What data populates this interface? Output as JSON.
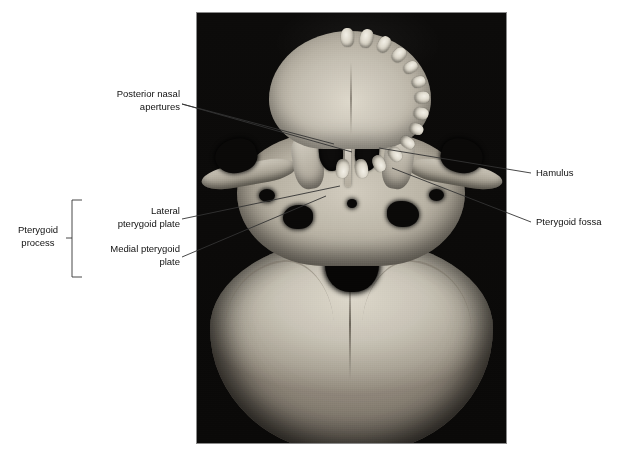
{
  "figure": {
    "background_color": "#ffffff",
    "photo": {
      "kind": "photograph",
      "subject": "inferior view of human skull base",
      "background_color": "#0a0908",
      "bone_color": "#c9c3b6",
      "border_color": "#8a8a8a",
      "x": 197,
      "y": 13,
      "width": 309,
      "height": 430
    },
    "line_color": "#333333",
    "labels": [
      {
        "id": "posterior-nasal-apertures",
        "text": "Posterior nasal\napertures",
        "align": "right",
        "x": 96,
        "y": 88,
        "width": 84,
        "leaders": [
          {
            "x1": 182,
            "y1": 104,
            "x2": 334,
            "y2": 144
          },
          {
            "x1": 182,
            "y1": 104,
            "x2": 352,
            "y2": 152
          }
        ]
      },
      {
        "id": "lateral-pterygoid-plate",
        "text": "Lateral\npterygoid plate",
        "align": "right",
        "x": 95,
        "y": 205,
        "width": 85,
        "leaders": [
          {
            "x1": 182,
            "y1": 219,
            "x2": 340,
            "y2": 186
          }
        ]
      },
      {
        "id": "medial-pterygoid-plate",
        "text": "Medial pterygoid\nplate",
        "align": "right",
        "x": 88,
        "y": 243,
        "width": 92,
        "leaders": [
          {
            "x1": 182,
            "y1": 257,
            "x2": 326,
            "y2": 196
          }
        ]
      },
      {
        "id": "pterygoid-process",
        "text": "Pterygoid\nprocess",
        "align": "center",
        "x": 10,
        "y": 224,
        "width": 56,
        "leaders": []
      },
      {
        "id": "hamulus",
        "text": "Hamulus",
        "align": "left",
        "x": 536,
        "y": 167,
        "width": 60,
        "leaders": [
          {
            "x1": 531,
            "y1": 173,
            "x2": 379,
            "y2": 148
          }
        ]
      },
      {
        "id": "pterygoid-fossa",
        "text": "Pterygoid fossa",
        "align": "left",
        "x": 536,
        "y": 216,
        "width": 88,
        "leaders": [
          {
            "x1": 531,
            "y1": 222,
            "x2": 392,
            "y2": 168
          }
        ]
      }
    ],
    "bracket": {
      "id": "pterygoid-process-bracket",
      "x": 72,
      "y_top": 200,
      "y_bottom": 277,
      "arm_length": 10,
      "tick_y": 238,
      "tick_length": 6
    }
  }
}
